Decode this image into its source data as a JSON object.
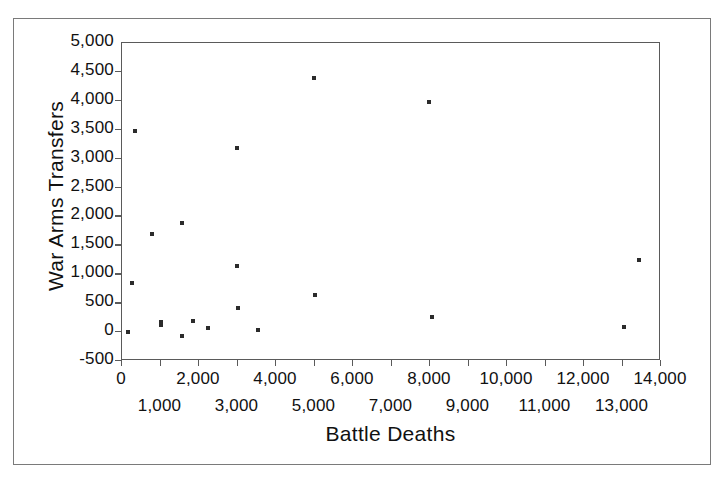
{
  "chart_data": {
    "type": "scatter",
    "title": "",
    "xlabel": "Battle Deaths",
    "ylabel": "War Arms Transfers",
    "xlim": [
      0,
      14000
    ],
    "ylim": [
      -500,
      5000
    ],
    "grid": false,
    "legend": null,
    "x_tick_labels_row1": [
      "0",
      "2,000",
      "4,000",
      "6,000",
      "8,000",
      "10,000",
      "12,000",
      "14,000"
    ],
    "x_tick_values_row1": [
      0,
      2000,
      4000,
      6000,
      8000,
      10000,
      12000,
      14000
    ],
    "x_tick_labels_row2": [
      "1,000",
      "3,000",
      "5,000",
      "7,000",
      "9,000",
      "11,000",
      "13,000"
    ],
    "x_tick_values_row2": [
      1000,
      3000,
      5000,
      7000,
      9000,
      11000,
      13000
    ],
    "y_tick_labels": [
      "5,000",
      "4,500",
      "4,000",
      "3,500",
      "3,000",
      "2,500",
      "2,000",
      "1,500",
      "1,000",
      "500",
      "0",
      "-500"
    ],
    "y_tick_values": [
      5000,
      4500,
      4000,
      3500,
      3000,
      2500,
      2000,
      1500,
      1000,
      500,
      0,
      -500
    ],
    "marker_color": "#2b2b2b",
    "points": [
      {
        "x": 150,
        "y": 0
      },
      {
        "x": 260,
        "y": 850
      },
      {
        "x": 340,
        "y": 3480
      },
      {
        "x": 780,
        "y": 1690
      },
      {
        "x": 1010,
        "y": 120
      },
      {
        "x": 1010,
        "y": 170
      },
      {
        "x": 1560,
        "y": 1880
      },
      {
        "x": 1560,
        "y": -60
      },
      {
        "x": 1840,
        "y": 190
      },
      {
        "x": 2230,
        "y": 70
      },
      {
        "x": 2990,
        "y": 3180
      },
      {
        "x": 2990,
        "y": 1140
      },
      {
        "x": 3000,
        "y": 410
      },
      {
        "x": 3530,
        "y": 30
      },
      {
        "x": 4990,
        "y": 4400
      },
      {
        "x": 5010,
        "y": 640
      },
      {
        "x": 7970,
        "y": 3980
      },
      {
        "x": 8050,
        "y": 260
      },
      {
        "x": 13050,
        "y": 90
      },
      {
        "x": 13430,
        "y": 1250
      }
    ]
  },
  "axis_titles": {
    "y": "War Arms Transfers",
    "x": "Battle Deaths"
  }
}
